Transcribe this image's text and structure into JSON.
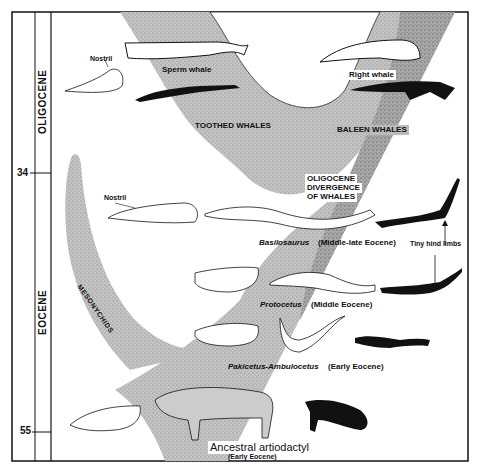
{
  "timescale": {
    "epochs": [
      {
        "name": "OLIGOCENE"
      },
      {
        "name": "EOCENE"
      }
    ],
    "ticks": [
      {
        "value": "34"
      },
      {
        "value": "55"
      }
    ]
  },
  "clades": {
    "toothed": "TOOTHED WHALES",
    "baleen": "BALEEN WHALES",
    "mesonychids": "MESONYCHIDS",
    "divergence": [
      "OLIGOCENE",
      "DIVERGENCE",
      "OF WHALES"
    ]
  },
  "taxa": {
    "sperm_whale": "Sperm whale",
    "right_whale": "Right whale",
    "basilosaurus_name": "Basilosaurus",
    "basilosaurus_age": "(Middle-late Eocene)",
    "protocetus_name": "Protocetus",
    "protocetus_age": "(Middle Eocene)",
    "pakicetus_name": "Pakicetus-Ambulocetus",
    "pakicetus_age": "(Early Eocene)",
    "ancestor_name": "Ancestral artiodactyl",
    "ancestor_age": "(Early Eocene)"
  },
  "annotations": {
    "nostril_top": "Nostril",
    "nostril_mid": "Nostril",
    "hind_limbs": "Tiny hind limbs"
  },
  "colors": {
    "stipple": "#b8b8b8",
    "stipple_dark": "#9a9a9a",
    "ink": "#111111"
  }
}
